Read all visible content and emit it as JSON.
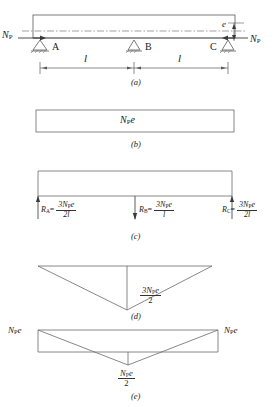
{
  "figure": {
    "symbols": {
      "prestress_force": "N",
      "prestress_force_sub": "P",
      "eccentricity": "e",
      "span": "l"
    },
    "panels": [
      {
        "id": "a",
        "caption": "(a)",
        "description": "Two-span continuous beam with supports A, B, C loaded by eccentric prestress force",
        "labels": {
          "force_left": "N",
          "force_left_sub": "P",
          "force_right": "N",
          "force_right_sub": "P",
          "eccentricity": "e",
          "support_a": "A",
          "support_b": "B",
          "support_c": "C",
          "span_left": "l",
          "span_right": "l"
        }
      },
      {
        "id": "b",
        "caption": "(b)",
        "description": "Primary moment diagram, uniform block",
        "labels": {
          "value": "N",
          "value_sub": "P",
          "value_tail": "e"
        }
      },
      {
        "id": "c",
        "caption": "(c)",
        "description": "Support reactions due to prestress",
        "reactions": [
          {
            "name": "R",
            "name_sub": "A",
            "numerator": "3N",
            "numerator_sub": "P",
            "numerator_tail": "e",
            "denominator": "2l"
          },
          {
            "name": "R",
            "name_sub": "B",
            "numerator": "3N",
            "numerator_sub": "P",
            "numerator_tail": "e",
            "denominator": "l"
          },
          {
            "name": "R",
            "name_sub": "C",
            "numerator": "3N",
            "numerator_sub": "P",
            "numerator_tail": "e",
            "denominator": "2l"
          }
        ]
      },
      {
        "id": "d",
        "caption": "(d)",
        "description": "Secondary (parasitic) moment diagram, triangular peak at centre support",
        "labels": {
          "numerator": "3N",
          "numerator_sub": "P",
          "numerator_tail": "e",
          "denominator": "2"
        }
      },
      {
        "id": "e",
        "caption": "(e)",
        "description": "Resultant moment diagram",
        "labels": {
          "left": "N",
          "left_sub": "P",
          "left_tail": "e",
          "right": "N",
          "right_sub": "P",
          "right_tail": "e",
          "centre_numerator": "N",
          "centre_numerator_sub": "P",
          "centre_numerator_tail": "e",
          "centre_denominator": "2"
        }
      }
    ],
    "colors": {
      "line": "#4a4a4a",
      "text": "#1a1a1a",
      "background": "#ffffff"
    }
  }
}
